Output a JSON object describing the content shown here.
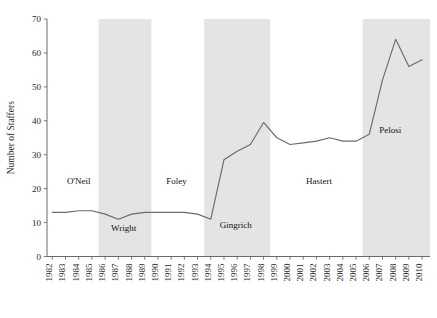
{
  "chart_data": {
    "type": "line",
    "title": "",
    "xlabel": "",
    "ylabel": "Number of Staffers",
    "ylim": [
      0,
      70
    ],
    "yticks": [
      0,
      10,
      20,
      30,
      40,
      50,
      60,
      70
    ],
    "grid": false,
    "legend": "none",
    "x": [
      1982,
      1983,
      1984,
      1985,
      1986,
      1987,
      1988,
      1989,
      1990,
      1991,
      1992,
      1993,
      1994,
      1995,
      1996,
      1997,
      1998,
      1999,
      2000,
      2001,
      2002,
      2003,
      2004,
      2005,
      2006,
      2007,
      2008,
      2009,
      2010
    ],
    "xtick_labels": [
      "1982",
      "1983",
      "1984",
      "1985",
      "1986",
      "1987",
      "1988",
      "1989",
      "1990",
      "1991",
      "1992",
      "1993",
      "1994",
      "1995",
      "1996",
      "1997",
      "1998",
      "1999",
      "2000",
      "2001",
      "2002",
      "2003",
      "2004",
      "2005",
      "2006",
      "2007",
      "2008",
      "2009",
      "2010"
    ],
    "series": [
      {
        "name": "Number of Staffers",
        "values": [
          13,
          13,
          13.5,
          13.5,
          12.5,
          11,
          12.5,
          13,
          13,
          13,
          13,
          12.5,
          11,
          28.5,
          31,
          33,
          39.5,
          35,
          33,
          33.5,
          34,
          35,
          34,
          34,
          36,
          52,
          64,
          56,
          58
        ]
      }
    ],
    "bands": [
      {
        "label": "Wright",
        "start": 1986,
        "end": 1989
      },
      {
        "label": "Gingrich",
        "start": 1994,
        "end": 1998
      },
      {
        "label": "Pelosi",
        "start": 2006,
        "end": 2010.5
      }
    ],
    "annotations": [
      {
        "label": "O'Neil",
        "x": 1984.0,
        "y": 21.5
      },
      {
        "label": "Wright",
        "x": 1987.4,
        "y": 7.5
      },
      {
        "label": "Foley",
        "x": 1991.4,
        "y": 21.5
      },
      {
        "label": "Gingrich",
        "x": 1995.9,
        "y": 8.3
      },
      {
        "label": "Hastert",
        "x": 2002.2,
        "y": 21.5
      },
      {
        "label": "Pelosi",
        "x": 2007.6,
        "y": 36.5
      }
    ],
    "colors": {
      "line": "#6b6b6b",
      "band": "#d9d9d9",
      "axis": "#5a5a5a",
      "text": "#1a1a1a",
      "background": "#ffffff"
    }
  }
}
